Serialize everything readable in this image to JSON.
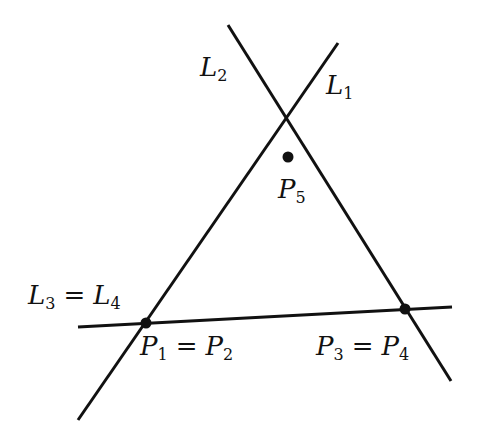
{
  "diagram": {
    "lines": [
      {
        "id": "L1",
        "x1": 338,
        "y1": 43,
        "x2": 78,
        "y2": 420
      },
      {
        "id": "L2",
        "x1": 228,
        "y1": 25,
        "x2": 451,
        "y2": 381
      },
      {
        "id": "L3=L4",
        "x1": 78,
        "y1": 327,
        "x2": 452,
        "y2": 307
      }
    ],
    "points": [
      {
        "id": "P1=P2",
        "x": 146,
        "y": 323
      },
      {
        "id": "P3=P4",
        "x": 405,
        "y": 309
      },
      {
        "id": "P5",
        "x": 288,
        "y": 157
      }
    ],
    "labels": {
      "L2": {
        "main": "L",
        "sub": "2"
      },
      "L1": {
        "main": "L",
        "sub": "1"
      },
      "P5": {
        "main": "P",
        "sub": "5"
      },
      "L34": {
        "a": "L",
        "asub": "3",
        "eq": "=",
        "b": "L",
        "bsub": "4"
      },
      "P12": {
        "a": "P",
        "asub": "1",
        "eq": "=",
        "b": "P",
        "bsub": "2"
      },
      "P34": {
        "a": "P",
        "asub": "3",
        "eq": "=",
        "b": "P",
        "bsub": "4"
      }
    },
    "colors": {
      "stroke": "#111111",
      "background": "#ffffff"
    }
  }
}
